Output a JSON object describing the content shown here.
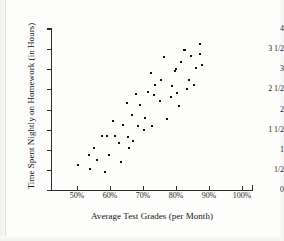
{
  "chart_data": {
    "type": "scatter",
    "title": "",
    "xlabel": "Average Test Grades (per Month)",
    "ylabel": "Time Spent Nightly on Homework (in Hours)",
    "xlim": [
      45,
      100
    ],
    "ylim": [
      0,
      4
    ],
    "grid": false,
    "legend": null,
    "xtick_labels": [
      "50%",
      "60%",
      "70%",
      "80%",
      "90%",
      "100%"
    ],
    "xtick_values": [
      50,
      60,
      70,
      80,
      90,
      100
    ],
    "ytick_labels": [
      "0",
      "1/2",
      "1",
      "1 1/2",
      "2",
      "2 1/2",
      "3",
      "3 1/2",
      "4"
    ],
    "ytick_values": [
      0,
      0.5,
      1,
      1.5,
      2,
      2.5,
      3,
      3.5,
      4
    ],
    "point_count": 50,
    "points": [
      [
        50.4,
        0.62
      ],
      [
        53.6,
        0.88
      ],
      [
        54.0,
        0.52
      ],
      [
        55.2,
        1.04
      ],
      [
        56.2,
        0.74
      ],
      [
        57.6,
        1.33
      ],
      [
        58.4,
        0.44
      ],
      [
        59.2,
        1.33
      ],
      [
        59.6,
        0.86
      ],
      [
        61.0,
        1.72
      ],
      [
        61.4,
        1.33
      ],
      [
        62.6,
        1.18
      ],
      [
        63.2,
        0.7
      ],
      [
        63.8,
        1.62
      ],
      [
        65.2,
        2.17
      ],
      [
        65.6,
        1.31
      ],
      [
        65.8,
        1.04
      ],
      [
        66.8,
        1.86
      ],
      [
        67.0,
        1.22
      ],
      [
        67.8,
        2.38
      ],
      [
        68.6,
        1.58
      ],
      [
        69.0,
        2.12
      ],
      [
        70.2,
        1.48
      ],
      [
        70.6,
        1.8
      ],
      [
        71.4,
        2.44
      ],
      [
        72.4,
        2.9
      ],
      [
        72.8,
        1.58
      ],
      [
        73.4,
        2.36
      ],
      [
        73.6,
        2.6
      ],
      [
        75.0,
        2.2
      ],
      [
        75.6,
        2.74
      ],
      [
        76.4,
        3.3
      ],
      [
        77.2,
        1.76
      ],
      [
        78.4,
        2.3
      ],
      [
        78.8,
        2.58
      ],
      [
        79.8,
        2.96
      ],
      [
        79.9,
        3.0
      ],
      [
        80.4,
        2.42
      ],
      [
        80.8,
        2.08
      ],
      [
        81.6,
        3.18
      ],
      [
        82.4,
        3.48
      ],
      [
        82.6,
        3.49
      ],
      [
        83.2,
        2.5
      ],
      [
        83.8,
        2.74
      ],
      [
        84.6,
        3.34
      ],
      [
        85.4,
        2.62
      ],
      [
        86.0,
        3.04
      ],
      [
        87.2,
        3.38
      ],
      [
        87.4,
        3.62
      ],
      [
        88.0,
        3.1
      ]
    ]
  }
}
